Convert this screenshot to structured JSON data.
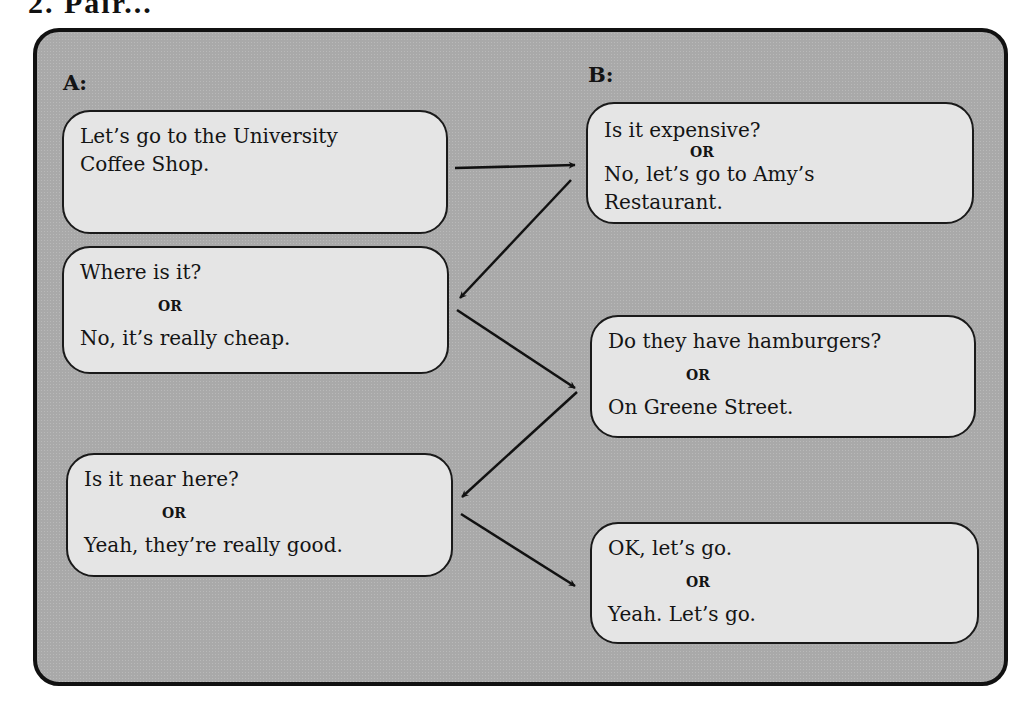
{
  "heading": {
    "text": "2. Pair..."
  },
  "speakers": {
    "a": "A:",
    "b": "B:"
  },
  "dialogue": {
    "a1": {
      "lines": [
        "Let’s go to the University",
        "Coffee Shop."
      ]
    },
    "b1": {
      "option1": "Is it expensive?",
      "or": "OR",
      "option2_lines": [
        "No, let’s go to Amy’s",
        "Restaurant."
      ]
    },
    "a2": {
      "option1": "Where is it?",
      "or": "OR",
      "option2": "No, it’s really cheap."
    },
    "b2": {
      "option1": "Do they have hamburgers?",
      "or": "OR",
      "option2": "On Greene Street."
    },
    "a3": {
      "option1": "Is it near here?",
      "or": "OR",
      "option2": "Yeah, they’re really good."
    },
    "b3": {
      "option1": "OK, let’s go.",
      "or": "OR",
      "option2": "Yeah. Let’s go."
    }
  },
  "arrows": [
    {
      "from": "a1",
      "to": "b1",
      "x1": 455,
      "y1": 168,
      "x2": 575,
      "y2": 165
    },
    {
      "from": "b1",
      "to": "a2",
      "x1": 571,
      "y1": 180,
      "x2": 460,
      "y2": 298
    },
    {
      "from": "a2",
      "to": "b2",
      "x1": 457,
      "y1": 310,
      "x2": 575,
      "y2": 388
    },
    {
      "from": "b2",
      "to": "a3",
      "x1": 577,
      "y1": 392,
      "x2": 462,
      "y2": 497
    },
    {
      "from": "a3",
      "to": "b3",
      "x1": 461,
      "y1": 514,
      "x2": 575,
      "y2": 586
    }
  ],
  "colors": {
    "panel": "#a9a9a9",
    "box": "#e5e5e5",
    "ink": "#141414"
  }
}
